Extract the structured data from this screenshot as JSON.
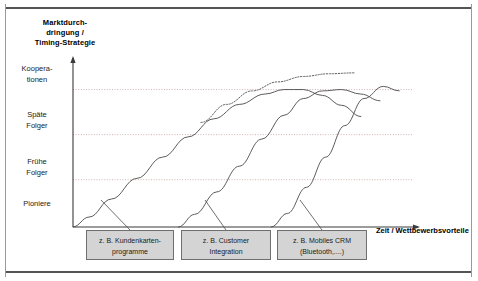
{
  "chart_data": {
    "type": "line",
    "ylabel": "Marktdurch-\ndringung /\nTiming-Strategie",
    "xlabel": "Zeit / Wettbewerbsvorteile",
    "grid": true,
    "legend": "none",
    "y_tick_labels": [
      "Koopera-\ntionen",
      "Späte\nFolger",
      "Frühe\nFolger",
      "Pioniere"
    ],
    "y_tick_values": [
      4,
      3,
      2,
      1
    ],
    "gridlines_at": [
      "Koopera-tionen",
      "Späte Folger",
      "Frühe Folger"
    ],
    "series": [
      {
        "name": "Pioniere-S-Kurve",
        "style": "solid",
        "x": [
          0.0,
          0.05,
          0.12,
          0.2,
          0.28,
          0.36,
          0.44,
          0.52,
          0.6,
          0.66,
          0.72,
          0.78,
          0.84,
          0.9
        ],
        "y": [
          0.0,
          0.22,
          0.62,
          1.08,
          1.55,
          2.0,
          2.4,
          2.72,
          2.95,
          3.05,
          3.05,
          2.92,
          2.7,
          2.45
        ]
      },
      {
        "name": "Fruehe-Folger-S-Kurve",
        "style": "solid",
        "x": [
          0.33,
          0.38,
          0.45,
          0.52,
          0.59,
          0.66,
          0.72,
          0.78,
          0.84,
          0.9,
          0.96
        ],
        "y": [
          0.0,
          0.28,
          0.78,
          1.35,
          1.95,
          2.48,
          2.85,
          3.02,
          3.05,
          2.95,
          2.8
        ]
      },
      {
        "name": "Spaete-Folger-S-Kurve",
        "style": "solid",
        "x": [
          0.62,
          0.67,
          0.73,
          0.79,
          0.85,
          0.91,
          0.97,
          1.02
        ],
        "y": [
          0.0,
          0.3,
          0.88,
          1.55,
          2.25,
          2.85,
          3.12,
          3.02
        ]
      },
      {
        "name": "Huellkurve",
        "style": "dotted",
        "x": [
          0.4,
          0.48,
          0.56,
          0.64,
          0.72,
          0.8,
          0.88
        ],
        "y": [
          2.32,
          2.72,
          3.02,
          3.22,
          3.34,
          3.4,
          3.42
        ]
      }
    ],
    "annotations": [
      {
        "label": "z. B. Kundenkarten-\nprogramme",
        "attached_to": "Pioniere-S-Kurve"
      },
      {
        "label": "z. B. Customer\nIntegration",
        "attached_to": "Fruehe-Folger-S-Kurve"
      },
      {
        "label": "z. B. Mobiles CRM\n(Bluetooth,....)",
        "attached_to": "Spaete-Folger-S-Kurve"
      }
    ],
    "colors": {
      "curve": "#4a4a4a",
      "gridline": "#c9a0a0",
      "axis": "#3a3a3a",
      "box_fill": "#d4d4d4",
      "box_border": "#6f6f6f",
      "frame": "#555555"
    }
  },
  "axis": {
    "y_caption_line1": "Marktdurch-",
    "y_caption_line2": "dringung /",
    "y_caption_line3": "Timing-Strategie",
    "x_caption": "Zeit / Wettbewerbsvorteile"
  },
  "yticks": [
    {
      "line1": "Koopera-",
      "line2": "tionen"
    },
    {
      "line1": "Späte",
      "line2": "Folger"
    },
    {
      "line1": "Frühe",
      "line2": "Folger"
    },
    {
      "line1": "Pioniere",
      "line2": ""
    }
  ],
  "boxes": [
    {
      "line1": "z. B. Kundenkarten-",
      "line2": "programme"
    },
    {
      "line1": "z. B. Customer",
      "line2": "Integration"
    },
    {
      "line1": "z. B. Mobiles CRM",
      "line2": "(Bluetooth,....)"
    }
  ]
}
